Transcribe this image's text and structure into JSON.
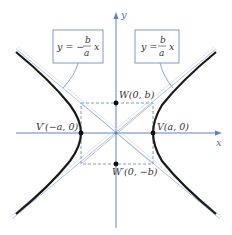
{
  "diagram": {
    "axes": {
      "x_label": "x",
      "y_label": "y"
    },
    "asymptotes": [
      {
        "id": "neg",
        "equation_prefix": "y = −",
        "numerator": "b",
        "denominator": "a",
        "suffix": "x"
      },
      {
        "id": "pos",
        "equation_prefix": "y = ",
        "numerator": "b",
        "denominator": "a",
        "suffix": "x"
      }
    ],
    "points": {
      "W": "W(0, b)",
      "W_prime": "W′(0, −b)",
      "V": "V(a, 0)",
      "V_prime": "V′(−a, 0)"
    },
    "colors": {
      "axis": "#5b82c4",
      "curve": "#1a1a1a",
      "asymptote": "#9fb4d8",
      "box": "#6f8fc9"
    }
  }
}
